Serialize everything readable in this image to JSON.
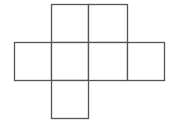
{
  "diagram": {
    "stroke_color": "#555555",
    "fill_color": "#ffffff",
    "cell_size": 38,
    "squares": [
      {
        "id": "top-left",
        "x": 51,
        "y": 4,
        "w": 37,
        "h": 38
      },
      {
        "id": "top-right",
        "x": 88,
        "y": 4,
        "w": 39,
        "h": 38
      },
      {
        "id": "mid-1",
        "x": 14,
        "y": 42,
        "w": 37,
        "h": 38
      },
      {
        "id": "mid-2",
        "x": 51,
        "y": 42,
        "w": 37,
        "h": 38
      },
      {
        "id": "mid-3",
        "x": 88,
        "y": 42,
        "w": 39,
        "h": 38
      },
      {
        "id": "mid-4",
        "x": 127,
        "y": 42,
        "w": 37,
        "h": 38
      },
      {
        "id": "bottom",
        "x": 51,
        "y": 80,
        "w": 37,
        "h": 38
      }
    ]
  }
}
